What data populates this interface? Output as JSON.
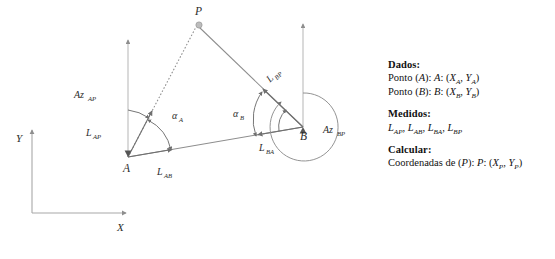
{
  "diagram": {
    "points": {
      "P": "P",
      "A": "A",
      "B": "B"
    },
    "axes": {
      "y_label": "Y",
      "x_label": "X"
    },
    "labels": {
      "az_ap": "Az",
      "az_ap_sub": "AP",
      "az_bp": "Az",
      "az_bp_sub": "BP",
      "l_ap": "L",
      "l_ap_sub": "AP",
      "l_ab": "L",
      "l_ab_sub": "AB",
      "l_ba": "L",
      "l_ba_sub": "BA",
      "l_bp": "L",
      "l_bp_sub": "BP",
      "alpha_a": "α",
      "alpha_a_sub": "A",
      "alpha_b": "α",
      "alpha_b_sub": "B"
    },
    "colors": {
      "line": "#8d8d8d",
      "ray": "#6f6f6f",
      "axis": "#a8a8a8",
      "marker": "#9a9a9a",
      "text": "#2b2b2b"
    }
  },
  "panel": {
    "dados": {
      "heading": "Dados:",
      "lines": [
        {
          "prefix": "Ponto (",
          "name": "A",
          "mid": "): ",
          "label": "A",
          "open": ": (",
          "x": "X",
          "xsub": "A",
          "sep": ", ",
          "y": "Y",
          "ysub": "A",
          "close": ")"
        },
        {
          "prefix": "Ponto (",
          "name": "B",
          "mid": "): ",
          "label": "B",
          "open": ": (",
          "x": "X",
          "xsub": "B",
          "sep": ", ",
          "y": "Y",
          "ysub": "B",
          "close": ")"
        }
      ]
    },
    "medidos": {
      "heading": "Medidos:",
      "items": [
        {
          "sym": "L",
          "sub": "AP"
        },
        {
          "sym": "L",
          "sub": "AB"
        },
        {
          "sym": "L",
          "sub": "BA"
        },
        {
          "sym": "L",
          "sub": "BP"
        }
      ]
    },
    "calcular": {
      "heading": "Calcular:",
      "line": {
        "prefix": "Coordenadas de (",
        "name": "P",
        "mid": "): ",
        "label": "P",
        "open": ": (",
        "x": "X",
        "xsub": "P",
        "sep": ", ",
        "y": "Y",
        "ysub": "P",
        "close": ")"
      }
    }
  },
  "caption": {
    "text": ""
  }
}
